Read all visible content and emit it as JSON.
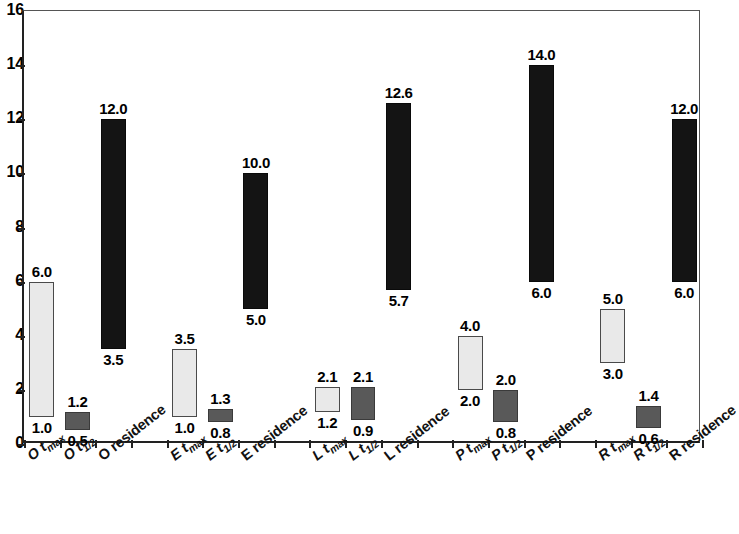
{
  "chart_data": {
    "type": "bar",
    "subtype": "floating-range-bar",
    "title": "",
    "xlabel": "",
    "ylabel": "",
    "ylim": [
      0,
      16
    ],
    "ytick_step": 2,
    "yticks": [
      0,
      2,
      4,
      6,
      8,
      10,
      12,
      14,
      16
    ],
    "grid": false,
    "legend": "none",
    "categories": [
      "O t_max",
      "O t_1/2",
      "O residence",
      "E t_max",
      "E t_1/2",
      "E residence",
      "L t_max",
      "L t_1/2",
      "L residence",
      "P t_max",
      "P t_1/2",
      "P residence",
      "R t_max",
      "R t_1/2",
      "R residence"
    ],
    "series": [
      {
        "name": "bar-bottom",
        "values": [
          1.0,
          0.5,
          3.5,
          1.0,
          0.8,
          5.0,
          1.2,
          0.9,
          5.7,
          2.0,
          0.8,
          6.0,
          3.0,
          0.6,
          6.0
        ]
      },
      {
        "name": "bar-top",
        "values": [
          6.0,
          1.2,
          12.0,
          3.5,
          1.3,
          10.0,
          2.1,
          2.1,
          12.6,
          4.0,
          2.0,
          14.0,
          5.0,
          1.4,
          12.0
        ]
      }
    ],
    "colors": {
      "tmax": "#e9e9e9",
      "thalf": "#595959",
      "residence": "#141414",
      "axis": "#222222"
    }
  },
  "bars": [
    {
      "prefix": "O",
      "kind": "tmax",
      "label_main": "O t",
      "label_sub": "max",
      "style": "light",
      "low": 1.0,
      "high": 6.0,
      "low_text": "1.0",
      "high_text": "6.0",
      "slot": 0
    },
    {
      "prefix": "O",
      "kind": "thalf",
      "label_main": "O t",
      "label_sub": "1/2",
      "style": "dark",
      "low": 0.5,
      "high": 1.2,
      "low_text": "0.5",
      "high_text": "1.2",
      "slot": 1
    },
    {
      "prefix": "O",
      "kind": "residence",
      "label_main": "O residence",
      "label_sub": "",
      "style": "black",
      "low": 3.5,
      "high": 12.0,
      "low_text": "3.5",
      "high_text": "12.0",
      "slot": 2
    },
    {
      "prefix": "E",
      "kind": "tmax",
      "label_main": "E t",
      "label_sub": "max",
      "style": "light",
      "low": 1.0,
      "high": 3.5,
      "low_text": "1.0",
      "high_text": "3.5",
      "slot": 4
    },
    {
      "prefix": "E",
      "kind": "thalf",
      "label_main": "E t",
      "label_sub": "1/2",
      "style": "dark",
      "low": 0.8,
      "high": 1.3,
      "low_text": "0.8",
      "high_text": "1.3",
      "slot": 5
    },
    {
      "prefix": "E",
      "kind": "residence",
      "label_main": "E residence",
      "label_sub": "",
      "style": "black",
      "low": 5.0,
      "high": 10.0,
      "low_text": "5.0",
      "high_text": "10.0",
      "slot": 6
    },
    {
      "prefix": "L",
      "kind": "tmax",
      "label_main": "L t",
      "label_sub": "max",
      "style": "light",
      "low": 1.2,
      "high": 2.1,
      "low_text": "1.2",
      "high_text": "2.1",
      "slot": 8
    },
    {
      "prefix": "L",
      "kind": "thalf",
      "label_main": "L t",
      "label_sub": "1/2",
      "style": "dark",
      "low": 0.9,
      "high": 2.1,
      "low_text": "0.9",
      "high_text": "2.1",
      "slot": 9
    },
    {
      "prefix": "L",
      "kind": "residence",
      "label_main": "L residence",
      "label_sub": "",
      "style": "black",
      "low": 5.7,
      "high": 12.6,
      "low_text": "5.7",
      "high_text": "12.6",
      "slot": 10
    },
    {
      "prefix": "P",
      "kind": "tmax",
      "label_main": "P t",
      "label_sub": "max",
      "style": "light",
      "low": 2.0,
      "high": 4.0,
      "low_text": "2.0",
      "high_text": "4.0",
      "slot": 12
    },
    {
      "prefix": "P",
      "kind": "thalf",
      "label_main": "P t",
      "label_sub": "1/2",
      "style": "dark",
      "low": 0.8,
      "high": 2.0,
      "low_text": "0.8",
      "high_text": "2.0",
      "slot": 13
    },
    {
      "prefix": "P",
      "kind": "residence",
      "label_main": "P residence",
      "label_sub": "",
      "style": "black",
      "low": 6.0,
      "high": 14.0,
      "low_text": "6.0",
      "high_text": "14.0",
      "slot": 14
    },
    {
      "prefix": "R",
      "kind": "tmax",
      "label_main": "R t",
      "label_sub": "max",
      "style": "light",
      "low": 3.0,
      "high": 5.0,
      "low_text": "3.0",
      "high_text": "5.0",
      "slot": 16
    },
    {
      "prefix": "R",
      "kind": "thalf",
      "label_main": "R t",
      "label_sub": "1/2",
      "style": "dark",
      "low": 0.6,
      "high": 1.4,
      "low_text": "0.6",
      "high_text": "1.4",
      "slot": 17
    },
    {
      "prefix": "R",
      "kind": "residence",
      "label_main": "R residence",
      "label_sub": "",
      "style": "black",
      "low": 6.0,
      "high": 12.0,
      "low_text": "6.0",
      "high_text": "12.0",
      "slot": 18
    }
  ],
  "axis": {
    "y_labels": [
      "16",
      "14",
      "12",
      "10",
      "8",
      "6",
      "4",
      "2",
      "0"
    ],
    "n_slots": 19
  }
}
